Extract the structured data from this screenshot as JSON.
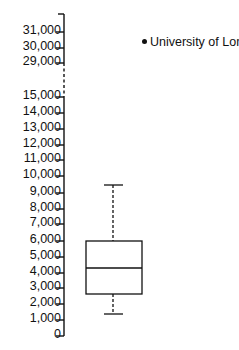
{
  "chart_data": {
    "type": "box",
    "title": "",
    "xlabel": "",
    "ylabel": "",
    "y_axis": {
      "broken": true,
      "break_between": [
        15000,
        29000
      ],
      "tick_labels": [
        "31,000",
        "30,000",
        "29,000",
        "15,000",
        "14,000",
        "13,000",
        "12,000",
        "11,000",
        "10,000",
        "9,000",
        "8,000",
        "7,000",
        "6,000",
        "5,000",
        "4,000",
        "3,000",
        "2,000",
        "1,000",
        "0"
      ],
      "tick_values": [
        31000,
        30000,
        29000,
        15000,
        14000,
        13000,
        12000,
        11000,
        10000,
        9000,
        8000,
        7000,
        6000,
        5000,
        4000,
        3000,
        2000,
        1000,
        0
      ]
    },
    "series": [
      {
        "name": "box",
        "whisker_low": 1400,
        "q1": 2600,
        "median": 4300,
        "q3": 6000,
        "whisker_high": 9400
      },
      {
        "name": "University of London",
        "type": "outlier-point",
        "value": 30000,
        "note": "legend marker for outlier"
      }
    ],
    "legend": [
      {
        "label": "University of London",
        "marker": "dot"
      }
    ],
    "grid": false
  },
  "legend": {
    "label": "University of London"
  },
  "ticks": [
    {
      "label": "31,000",
      "y": 32
    },
    {
      "label": "30,000",
      "y": 48
    },
    {
      "label": "29,000",
      "y": 63
    },
    {
      "label": "15,000",
      "y": 97
    },
    {
      "label": "14,000",
      "y": 113
    },
    {
      "label": "13,000",
      "y": 129
    },
    {
      "label": "12,000",
      "y": 145
    },
    {
      "label": "11,000",
      "y": 160
    },
    {
      "label": "10,000",
      "y": 176
    },
    {
      "label": "9,000",
      "y": 193
    },
    {
      "label": "8,000",
      "y": 209
    },
    {
      "label": "7,000",
      "y": 224
    },
    {
      "label": "6,000",
      "y": 241
    },
    {
      "label": "5,000",
      "y": 257
    },
    {
      "label": "4,000",
      "y": 273
    },
    {
      "label": "3,000",
      "y": 288
    },
    {
      "label": "2,000",
      "y": 304
    },
    {
      "label": "1,000",
      "y": 320
    },
    {
      "label": "0",
      "y": 336
    }
  ]
}
